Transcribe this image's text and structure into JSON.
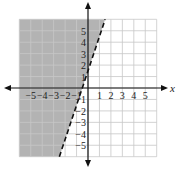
{
  "chart_data": {
    "type": "line",
    "title": "",
    "xlabel": "x",
    "ylabel": "y",
    "xlim": [
      -6,
      6
    ],
    "ylim": [
      -6,
      6
    ],
    "grid": true,
    "x_ticks": [
      -5,
      -4,
      -3,
      -2,
      -1,
      1,
      2,
      3,
      4,
      5
    ],
    "y_ticks": [
      -5,
      -4,
      -3,
      -2,
      -1,
      1,
      2,
      3,
      4,
      5
    ],
    "x_tick_labels": [
      "−5",
      "−4",
      "−3",
      "−2",
      "−1",
      "1",
      "2",
      "3",
      "4",
      "5"
    ],
    "y_tick_labels": [
      "−5",
      "−4",
      "−3",
      "−2",
      "−1",
      "1",
      "2",
      "3",
      "4",
      "5"
    ],
    "series": [
      {
        "name": "boundary line",
        "style": "dashed",
        "equation": "y = 3x + 3/2",
        "slope": 3,
        "intercept": 1.5,
        "points": [
          [
            -2.5,
            -6
          ],
          [
            1.5,
            6
          ]
        ]
      }
    ],
    "shaded_region": {
      "side": "left/above boundary",
      "inequality": "y > 3x + 3/2",
      "color": "#b3b3b3"
    }
  },
  "axis_labels": {
    "x": "x",
    "y": "y"
  },
  "colors": {
    "shade": "#b3b3b3",
    "grid": "#c8c8c8",
    "axis": "#111111",
    "line": "#111111"
  }
}
